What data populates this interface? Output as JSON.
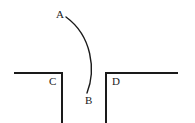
{
  "diagram": {
    "type": "line-diagram",
    "background_color": "#ffffff",
    "stroke_color": "#1a1a1a",
    "canvas": {
      "width": 195,
      "height": 123
    },
    "labels": [
      {
        "id": "A",
        "text": "A",
        "x": 56,
        "y": 9,
        "describes": "upper endpoint of curved arc"
      },
      {
        "id": "B",
        "text": "B",
        "x": 85,
        "y": 95,
        "describes": "lower endpoint of curved arc"
      },
      {
        "id": "C",
        "text": "C",
        "x": 49,
        "y": 76,
        "describes": "inner corner of left angled line"
      },
      {
        "id": "D",
        "text": "D",
        "x": 112,
        "y": 76,
        "describes": "inner corner of right angled line"
      }
    ],
    "shapes": [
      {
        "name": "curved-arc-ab",
        "kind": "curve",
        "start": [
          66,
          17
        ],
        "control1": [
          92,
          36
        ],
        "control2": [
          96,
          70
        ],
        "end": [
          87,
          93
        ],
        "stroke_width": 1.4
      },
      {
        "name": "left-corner-line-c",
        "kind": "polyline",
        "points": [
          [
            14,
            73
          ],
          [
            62,
            73
          ],
          [
            62,
            123
          ]
        ],
        "stroke_width": 2
      },
      {
        "name": "right-corner-line-d",
        "kind": "polyline",
        "points": [
          [
            178,
            73
          ],
          [
            106,
            73
          ],
          [
            106,
            123
          ]
        ],
        "stroke_width": 2
      }
    ],
    "curve_tick": {
      "name": "arc-leader-tick",
      "from": [
        64,
        15
      ],
      "to": [
        68,
        19
      ]
    }
  }
}
